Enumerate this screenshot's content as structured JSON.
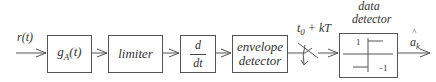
{
  "diagram": {
    "input_label": "r(t)",
    "blocks": [
      {
        "id": "matched-filter",
        "label_main": "g",
        "label_sub": "A",
        "label_arg": "(t)"
      },
      {
        "id": "limiter",
        "label": "limiter"
      },
      {
        "id": "differentiator",
        "numerator": "d",
        "denominator": "dt"
      },
      {
        "id": "envelope-detector",
        "line1": "envelope",
        "line2": "detector"
      },
      {
        "id": "data-detector",
        "title_line1": "data",
        "title_line2": "detector",
        "level_high": "1",
        "level_low": "−1"
      }
    ],
    "sampler_label_base": "t",
    "sampler_label_sub": "0",
    "sampler_label_rest": " + kT",
    "output_label_hat": "^",
    "output_label_base": "a",
    "output_label_sub": "k"
  },
  "colors": {
    "stroke": "#555555",
    "text": "#333333",
    "background": "#ffffff"
  }
}
